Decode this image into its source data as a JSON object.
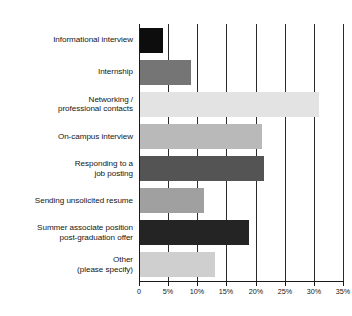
{
  "chart_data": {
    "type": "bar",
    "orientation": "horizontal",
    "title": "",
    "subtitle": "",
    "xlabel": "",
    "ylabel": "",
    "xlim": [
      0,
      35
    ],
    "grid": true,
    "legend": false,
    "tick_labels": [
      "0",
      "5%",
      "10%",
      "15%",
      "20%",
      "25%",
      "30%",
      "35%"
    ],
    "tick_values": [
      0,
      5,
      10,
      15,
      20,
      25,
      30,
      35
    ],
    "categories": [
      "Informational interview",
      "Internship",
      "Networking / professional contacts",
      "On-campus interview",
      "Responding to a job posting",
      "Sending unsolicited resume",
      "Summer associate position post-graduation offer",
      "Other (please specify)"
    ],
    "category_lines": [
      [
        "Informational interview"
      ],
      [
        "Internship"
      ],
      [
        "Networking /",
        "professional contacts"
      ],
      [
        "On-campus interview"
      ],
      [
        "Responding to a",
        "job posting"
      ],
      [
        "Sending unsolicited resume"
      ],
      [
        "Summer associate position",
        "post-graduation offer"
      ],
      [
        "Other",
        "(please specify)"
      ]
    ],
    "values": [
      3.9,
      8.8,
      30.7,
      20.9,
      21.2,
      10.9,
      18.7,
      12.9
    ],
    "bar_colors": [
      "#0d0d0d",
      "#757575",
      "#e3e3e3",
      "#b9b9b9",
      "#545454",
      "#a0a0a0",
      "#242424",
      "#cfcfcf"
    ],
    "axis_color": "#1a1a1a",
    "grid_color": "#2b2b2b",
    "text_color": "#151515",
    "background": "#ffffff"
  }
}
